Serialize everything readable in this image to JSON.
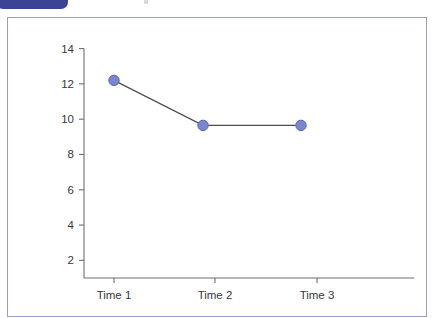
{
  "top_bar": {
    "tab_icon": "rounded-blue-tab",
    "accent_color": "#3b4395"
  },
  "chart_data": {
    "type": "line",
    "title": "",
    "subtitle": "",
    "xlabel": "",
    "ylabel": "",
    "categories": [
      "Time 1",
      "Time 2",
      "Time 3"
    ],
    "series": [
      {
        "name": "Series 1",
        "values": [
          12.2,
          9.65,
          9.65
        ],
        "marker": "circle",
        "marker_color": "#7b86cc",
        "marker_edge_color": "#5a64b4",
        "line_color": "#4d4d4d"
      }
    ],
    "ylim": [
      1,
      14.6
    ],
    "yticks": [
      2,
      4,
      6,
      8,
      10,
      12,
      14
    ],
    "ytick_labels": [
      "2",
      "4",
      "6",
      "8",
      "10",
      "12",
      "14"
    ],
    "xticks": [
      "Time 1",
      "Time 2",
      "Time 3"
    ],
    "grid": false,
    "legend": false,
    "axis_color": "#6e6e72",
    "frame_border_color": "#9a9ec4",
    "background_color": "#ffffff"
  }
}
